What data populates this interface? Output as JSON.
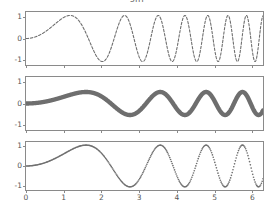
{
  "figure": {
    "title": "sin",
    "background_color": "#ffffff",
    "axis_color": "#8a8a8a",
    "tick_label_color": "#555555",
    "width": 274,
    "height": 219
  },
  "chart_data": {
    "type": "line",
    "title": "sin",
    "xlabel": "",
    "ylabel": "",
    "xlim": [
      0,
      6.2831853
    ],
    "ylim": [
      -1.15,
      1.15
    ],
    "grid": false,
    "legend": "none",
    "shared_x_axis": true,
    "x_ticks": [
      0,
      1,
      2,
      3,
      4,
      5,
      6
    ],
    "x_tick_labels": [
      "0",
      "1",
      "2",
      "3",
      "4",
      "5",
      "6"
    ],
    "y_ticks": [
      1,
      0,
      -1
    ],
    "y_tick_labels": [
      "1",
      "0",
      "-1"
    ],
    "x_tick_labels_shown_on": "bottom_panel_only",
    "subplots": [
      {
        "index": 0,
        "name": "chirp-fast-dashed",
        "style": "dashed",
        "linewidth": 1.1,
        "color": "#6e6e6e",
        "amplitude": 1.0,
        "description": "Chirp: amplitude 1, frequency sweeps from near 0 to high; ~12 oscillations across 0 to 2pi",
        "formula": "y = sin(x^2 * 1.15)",
        "cycles_visible": 12,
        "y_ticks": [
          1,
          0,
          -1
        ],
        "y_tick_labels": [
          "1",
          "0",
          "-1"
        ]
      },
      {
        "index": 1,
        "name": "chirp-slow-thick-solid",
        "style": "solid",
        "linewidth": 4.5,
        "color": "#6e6e6e",
        "amplitude": 0.5,
        "description": "Chirp with reduced amplitude 0.5, thick solid stroke, ~6 oscillations across 0 to 2pi",
        "formula": "y = 0.5 * sin(x^2 * 0.62)",
        "cycles_visible": 6,
        "y_ticks": [
          1,
          0,
          -1
        ],
        "y_tick_labels": [
          "1",
          "0",
          "-1"
        ]
      },
      {
        "index": 2,
        "name": "chirp-dotted-markers",
        "style": "dotted",
        "linewidth": 1.6,
        "color": "#6e6e6e",
        "amplitude": 1.0,
        "description": "Chirp at full amplitude 1 drawn with dense dot markers, ~6 oscillations across 0 to 2pi",
        "formula": "y = sin(x^2 * 0.62)",
        "cycles_visible": 6,
        "y_ticks": [
          1,
          0,
          -1
        ],
        "y_tick_labels": [
          "1",
          "0",
          "-1"
        ]
      }
    ],
    "series": [
      {
        "name": "chirp-fast-dashed",
        "x": [
          0.0,
          0.26,
          0.52,
          0.79,
          1.05,
          1.31,
          1.57,
          1.83,
          2.09,
          2.36,
          2.62,
          2.88,
          3.14,
          3.4,
          3.67,
          3.93,
          4.19,
          4.45,
          4.71,
          4.97,
          5.24,
          5.5,
          5.76,
          6.02,
          6.28
        ],
        "values": [
          0.0,
          0.08,
          0.31,
          0.67,
          0.95,
          0.88,
          0.25,
          -0.62,
          -0.99,
          -0.1,
          0.96,
          0.36,
          -0.88,
          -0.72,
          0.68,
          0.89,
          -0.3,
          -1.0,
          -0.04,
          0.98,
          0.19,
          -0.96,
          -0.49,
          0.81,
          0.85
        ]
      },
      {
        "name": "chirp-slow-thick-solid",
        "x": [
          0.0,
          0.26,
          0.52,
          0.79,
          1.05,
          1.31,
          1.57,
          1.83,
          2.09,
          2.36,
          2.62,
          2.88,
          3.14,
          3.4,
          3.67,
          3.93,
          4.19,
          4.45,
          4.71,
          4.97,
          5.24,
          5.5,
          5.76,
          6.02,
          6.28
        ],
        "values": [
          0.0,
          0.02,
          0.08,
          0.19,
          0.33,
          0.45,
          0.5,
          0.4,
          0.1,
          -0.3,
          -0.5,
          -0.27,
          0.23,
          0.5,
          0.14,
          -0.45,
          -0.34,
          0.33,
          0.46,
          -0.2,
          -0.5,
          0.09,
          0.5,
          0.02,
          -0.5
        ]
      },
      {
        "name": "chirp-dotted-markers",
        "x": [
          0.0,
          0.26,
          0.52,
          0.79,
          1.05,
          1.31,
          1.57,
          1.83,
          2.09,
          2.36,
          2.62,
          2.88,
          3.14,
          3.4,
          3.67,
          3.93,
          4.19,
          4.45,
          4.71,
          4.97,
          5.24,
          5.5,
          5.76,
          6.02,
          6.28
        ],
        "values": [
          0.0,
          0.04,
          0.17,
          0.38,
          0.67,
          0.9,
          1.0,
          0.8,
          0.21,
          -0.6,
          -1.0,
          -0.54,
          0.46,
          1.0,
          0.28,
          -0.9,
          -0.68,
          0.66,
          0.92,
          -0.4,
          -1.0,
          0.18,
          1.0,
          0.04,
          -1.0
        ]
      }
    ]
  }
}
